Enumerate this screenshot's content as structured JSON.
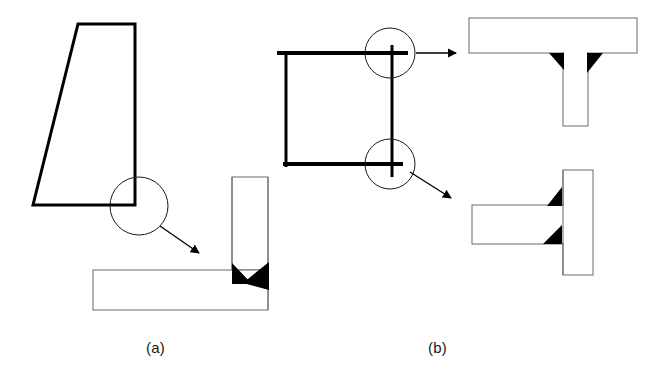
{
  "figure": {
    "width": 661,
    "height": 378,
    "background": "#ffffff",
    "line_color": "#000000",
    "thin_line_color": "#6b6b6b",
    "weld_fill": "#000000"
  },
  "captions": [
    {
      "id": "a",
      "label": "(a)",
      "x": 146,
      "y": 339
    },
    {
      "id": "b",
      "label": "(b)",
      "x": 428,
      "y": 339
    }
  ],
  "panels": [
    {
      "id": "panel-a",
      "caption": "(a)",
      "structure": {
        "name": "tapered-plate-girder",
        "type": "trapezoid",
        "stroke_width": 3,
        "points": "78,24 135,24 135,205 33,205"
      },
      "detail_circle": {
        "name": "detail-circle-a",
        "cx": 139,
        "cy": 206,
        "r": 29,
        "stroke_width": 1
      },
      "arrow": {
        "name": "detail-arrow-a",
        "x1": 160,
        "y1": 226,
        "x2": 200,
        "y2": 254,
        "stroke_width": 1.3
      },
      "detail_view": {
        "name": "fillet-weld-tee-joint-detail",
        "vertical_member": {
          "x": 232,
          "y": 177,
          "w": 36,
          "h": 93
        },
        "horizontal_member": {
          "x": 93,
          "y": 270,
          "w": 175,
          "h": 40
        },
        "welds": [
          {
            "name": "weld-left-fillet",
            "points": "232,264 232,283 251,283"
          },
          {
            "name": "weld-right-fillet",
            "points": "268,264 268,288 246,283"
          }
        ]
      }
    },
    {
      "id": "panel-b",
      "caption": "(b)",
      "structure": {
        "name": "portal-frame",
        "stroke_width": 4,
        "top_beam": {
          "x1": 277,
          "y1": 53,
          "x2": 406,
          "y2": 53
        },
        "bottom_beam": {
          "x1": 283,
          "y1": 164,
          "x2": 401,
          "y2": 164
        },
        "left_column": {
          "x1": 286,
          "y1": 53,
          "x2": 286,
          "y2": 166
        },
        "right_column": {
          "x1": 392,
          "y1": 45,
          "x2": 392,
          "y2": 176
        }
      },
      "detail_circles": [
        {
          "name": "detail-circle-b-top",
          "cx": 390,
          "cy": 53,
          "r": 25
        },
        {
          "name": "detail-circle-b-bottom",
          "cx": 390,
          "cy": 164,
          "r": 25
        }
      ],
      "arrows": [
        {
          "name": "detail-arrow-b-top",
          "x1": 418,
          "y1": 53,
          "x2": 455,
          "y2": 53
        },
        {
          "name": "detail-arrow-b-bottom",
          "x1": 411,
          "y1": 171,
          "x2": 452,
          "y2": 199
        }
      ],
      "detail_views": [
        {
          "name": "beam-to-column-top-detail",
          "horizontal_member": {
            "x": 469,
            "y": 18,
            "w": 168,
            "h": 35
          },
          "vertical_member": {
            "x": 563,
            "y": 53,
            "w": 25,
            "h": 73
          },
          "welds": [
            {
              "name": "weld-left-fillet-top",
              "points": "549,53 563,53 563,70"
            },
            {
              "name": "weld-right-fillet-top",
              "points": "588,53 602,53 588,72"
            }
          ]
        },
        {
          "name": "beam-to-column-bottom-detail",
          "vertical_member": {
            "x": 563,
            "y": 170,
            "w": 30,
            "h": 105
          },
          "horizontal_member": {
            "x": 472,
            "y": 205,
            "w": 91,
            "h": 39
          },
          "welds": [
            {
              "name": "weld-top-fillet-bottom",
              "points": "563,188 563,205 549,205"
            },
            {
              "name": "weld-bottom-fillet-bottom",
              "points": "563,226 563,244 545,244"
            }
          ]
        }
      ]
    }
  ]
}
